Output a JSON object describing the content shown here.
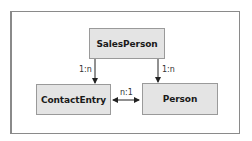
{
  "diagram": {
    "type": "entity-relationship",
    "entities": [
      {
        "id": "salesperson",
        "label": "SalesPerson"
      },
      {
        "id": "contactentry",
        "label": "ContactEntry"
      },
      {
        "id": "person",
        "label": "Person"
      }
    ],
    "relationships": [
      {
        "from": "SalesPerson",
        "to": "ContactEntry",
        "cardinality": "1:n",
        "direction": "one-way"
      },
      {
        "from": "SalesPerson",
        "to": "Person",
        "cardinality": "1:n",
        "direction": "one-way"
      },
      {
        "from": "ContactEntry",
        "to": "Person",
        "cardinality": "n:1",
        "direction": "bidirectional"
      }
    ],
    "colors": {
      "entity_fill": "#e4e4e4",
      "entity_border": "#9a9a9a",
      "frame_border": "#8a8a8a",
      "line": "#222222"
    }
  }
}
